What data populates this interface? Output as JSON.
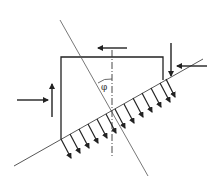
{
  "diagram": {
    "type": "inclined-block-force-diagram",
    "angle_label": "φ",
    "colors": {
      "background": "#ffffff",
      "stroke": "#222222",
      "line": "#444444"
    },
    "elements": {
      "block": "rectangular block resting on inclined shear plane",
      "inclined_plane": "line at angle through block",
      "steep_line": "line crossing block at angle φ to vertical",
      "vertical_axis": "dash-dot vertical centerline",
      "distributed_load": "arrows along inclined plane pointing down-right",
      "top_arrow": "horizontal arrow pointing left above block",
      "right_vertical_arrow": "arrow pointing down at top-right",
      "right_horizontal_arrow": "arrow pointing left at right",
      "left_horizontal_arrow": "arrow pointing right at left",
      "left_vertical_arrow": "arrow pointing up at left"
    }
  }
}
